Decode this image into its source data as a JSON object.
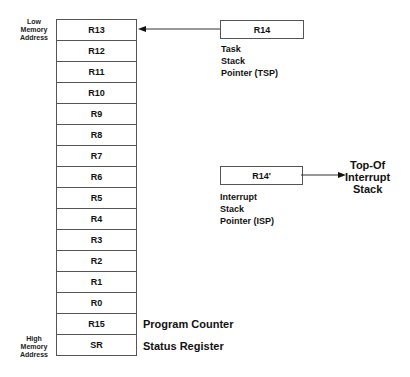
{
  "labels": {
    "low": [
      "Low",
      "Memory",
      "Address"
    ],
    "high": [
      "High",
      "Memory",
      "Address"
    ]
  },
  "stack": [
    "R13",
    "R12",
    "R11",
    "R10",
    "R9",
    "R8",
    "R7",
    "R6",
    "R5",
    "R4",
    "R3",
    "R2",
    "R1",
    "R0",
    "R15",
    "SR"
  ],
  "annotations": {
    "r15": "Program Counter",
    "sr": "Status Register"
  },
  "tsp": {
    "register": "R14",
    "lines": [
      "Task",
      "Stack",
      "Pointer (TSP)"
    ]
  },
  "isp": {
    "register": "R14'",
    "lines": [
      "Interrupt",
      "Stack",
      "Pointer (ISP)"
    ],
    "target": [
      "Top-Of",
      "Interrupt",
      "Stack"
    ]
  }
}
